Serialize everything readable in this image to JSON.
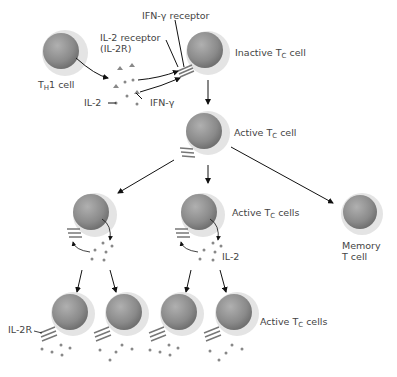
{
  "diagram": {
    "type": "biology-flow",
    "labels": {
      "th1_cell": {
        "main": "T",
        "sub": "H",
        "rest": "1 cell"
      },
      "il2_receptor": {
        "line1": "IL-2 receptor",
        "line2": "(IL-2R)"
      },
      "ifn_receptor": "IFN-γ receptor",
      "inactive_tc": {
        "pre": "Inactive T",
        "sub": "C",
        "post": " cell"
      },
      "il2": "IL-2",
      "ifn_gamma": "IFN-γ",
      "active_tc": {
        "pre": "Active T",
        "sub": "C",
        "post": " cell"
      },
      "active_tc_cells_mid": {
        "pre": "Active T",
        "sub": "C",
        "post": " cells"
      },
      "il2_mid": "IL-2",
      "memory": {
        "line1": "Memory",
        "line2": "T cell"
      },
      "il2r_bottom": "IL-2R",
      "active_tc_cells_bottom": {
        "pre": "Active T",
        "sub": "C",
        "post": " cells"
      }
    },
    "colors": {
      "cell_outer": "#e4e4e4",
      "cell_inner": "#8c8c8c",
      "arrow": "#111111",
      "dot": "#777777",
      "text": "#444444"
    }
  }
}
